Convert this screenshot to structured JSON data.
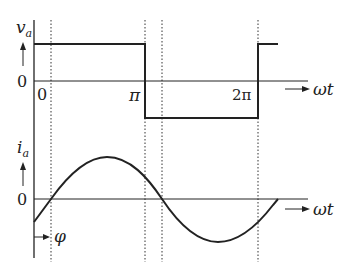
{
  "diagram": {
    "top_plot": {
      "y_label": "v",
      "y_label_sub": "a",
      "zero_label": "0",
      "x_axis_label": "ωt",
      "tick_labels": [
        "0",
        "π",
        "2π"
      ],
      "waveform": "square"
    },
    "bottom_plot": {
      "y_label": "i",
      "y_label_sub": "a",
      "zero_label": "0",
      "x_axis_label": "ωt",
      "phase_label": "φ",
      "waveform": "sine (lagging by φ)"
    },
    "colors": {
      "line": "#222222",
      "background": "#ffffff"
    }
  }
}
